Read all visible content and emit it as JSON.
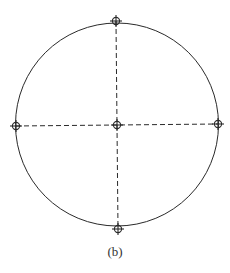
{
  "figure": {
    "caption": "(b)",
    "stroke_color": "#2a2a2a",
    "circle": {
      "cx": 117,
      "cy": 124.5,
      "r": 101.5
    },
    "lines": {
      "horizontal": {
        "x1": 16,
        "y1": 126,
        "x2": 218,
        "y2": 124,
        "style": "dashed"
      },
      "vertical": {
        "x1": 116,
        "y1": 21,
        "x2": 118,
        "y2": 229,
        "style": "dashed"
      }
    },
    "markers": [
      {
        "name": "top",
        "x": 116,
        "y": 21
      },
      {
        "name": "left",
        "x": 16,
        "y": 126
      },
      {
        "name": "center",
        "x": 117,
        "y": 125
      },
      {
        "name": "right",
        "x": 218,
        "y": 124
      },
      {
        "name": "bottom",
        "x": 118,
        "y": 229
      }
    ]
  }
}
